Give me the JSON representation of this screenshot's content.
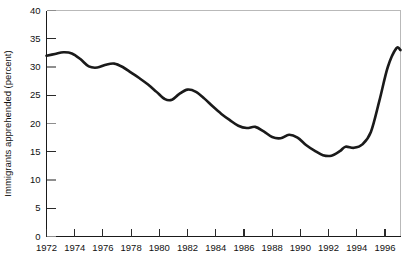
{
  "chart_data": {
    "type": "line",
    "title": "",
    "xlabel": "",
    "ylabel": "Immigrants apprehended (percent)",
    "xlim": [
      1972,
      1997.1
    ],
    "ylim": [
      0,
      40
    ],
    "grid": false,
    "legend": "none",
    "xticks": [
      1972,
      1974,
      1976,
      1978,
      1980,
      1982,
      1984,
      1986,
      1988,
      1990,
      1992,
      1994,
      1996
    ],
    "xtick_labels": [
      "1972",
      "1974",
      "1976",
      "1978",
      "1980",
      "1982",
      "1984",
      "1986",
      "1988",
      "1990",
      "1992",
      "1994",
      "1996"
    ],
    "yticks": [
      0,
      5,
      10,
      15,
      20,
      25,
      30,
      35,
      40
    ],
    "ytick_labels": [
      "0",
      "5",
      "10",
      "15",
      "20",
      "25",
      "30",
      "35",
      "40"
    ],
    "series": [
      {
        "name": "Immigrants apprehended (percent)",
        "x": [
          1972.0,
          1972.6,
          1973.2,
          1973.8,
          1974.4,
          1975.0,
          1975.6,
          1976.2,
          1976.8,
          1977.4,
          1978.0,
          1978.6,
          1979.2,
          1979.8,
          1980.4,
          1980.9,
          1981.4,
          1982.0,
          1982.6,
          1983.2,
          1983.8,
          1984.4,
          1985.0,
          1985.6,
          1986.2,
          1986.8,
          1987.4,
          1988.0,
          1988.6,
          1989.2,
          1989.8,
          1990.4,
          1991.0,
          1991.6,
          1992.2,
          1992.8,
          1993.2,
          1993.8,
          1994.4,
          1995.0,
          1995.6,
          1996.2,
          1996.8,
          1997.1
        ],
        "y": [
          32.0,
          32.3,
          32.6,
          32.4,
          31.4,
          30.1,
          29.9,
          30.4,
          30.6,
          30.0,
          29.0,
          28.0,
          26.9,
          25.6,
          24.3,
          24.2,
          25.2,
          26.0,
          25.6,
          24.4,
          23.0,
          21.7,
          20.6,
          19.6,
          19.2,
          19.4,
          18.6,
          17.6,
          17.4,
          18.0,
          17.5,
          16.2,
          15.2,
          14.4,
          14.3,
          15.1,
          15.9,
          15.7,
          16.3,
          18.5,
          24.0,
          30.0,
          33.3,
          33.0
        ]
      }
    ]
  },
  "figure": {
    "background_color": "#ffffff",
    "line_color": "#1a1a1a",
    "axis_color": "#1a1a1a",
    "frame_color": "#b9b9b9"
  }
}
